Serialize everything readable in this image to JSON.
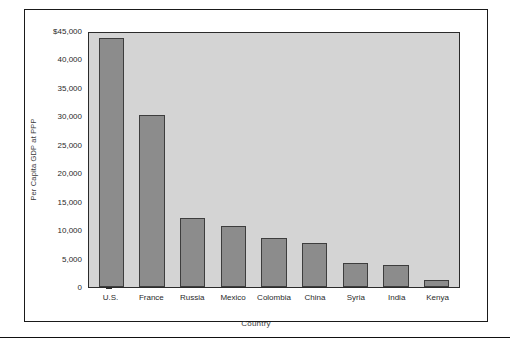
{
  "chart_data": {
    "type": "bar",
    "title": "",
    "xlabel": "Country",
    "ylabel": "Per Capita GDP at PPP",
    "categories": [
      "U.S.",
      "France",
      "Russia",
      "Mexico",
      "Colombia",
      "China",
      "Syria",
      "India",
      "Kenya"
    ],
    "values": [
      43800,
      30200,
      12100,
      10700,
      8600,
      7800,
      4200,
      3900,
      1300
    ],
    "ylim": [
      0,
      45000
    ],
    "ytick_values": [
      0,
      5000,
      10000,
      15000,
      20000,
      25000,
      30000,
      35000,
      40000,
      45000
    ],
    "ytick_labels": [
      "0",
      "5,000",
      "10,000",
      "15,000",
      "20,000",
      "25,000",
      "30,000",
      "35,000",
      "40,000",
      "$45,000"
    ],
    "grid": false,
    "legend": null,
    "bar_color": "#8c8c8c",
    "bar_edge_color": "#3d3d3d",
    "plot_background": "#d4d4d4",
    "frame_color": "#1a1a1a"
  }
}
